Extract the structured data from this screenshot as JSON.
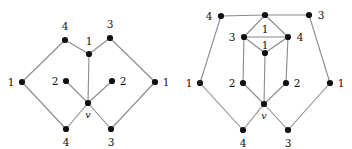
{
  "figure": {
    "background_color": "#ffffff",
    "edge_color": "#8a8a8a",
    "node_color": "#111111",
    "width": 352,
    "height": 149
  },
  "chart_data": {
    "type": "diagram",
    "title": "",
    "diagrams": [
      {
        "name": "left-graph",
        "nodes": [
          {
            "id": "L-top-left-4",
            "label": "4",
            "x": 65,
            "y": 40,
            "label_x": 65,
            "label_y": 26
          },
          {
            "id": "L-top-right-3",
            "label": "3",
            "x": 110,
            "y": 38,
            "label_x": 110,
            "label_y": 24
          },
          {
            "id": "L-inner-1",
            "label": "1",
            "x": 89,
            "y": 54,
            "label_x": 89,
            "label_y": 41
          },
          {
            "id": "L-left-1",
            "label": "1",
            "x": 22,
            "y": 82,
            "label_x": 11,
            "label_y": 82
          },
          {
            "id": "L-right-1",
            "label": "1",
            "x": 155,
            "y": 82,
            "label_x": 166,
            "label_y": 82
          },
          {
            "id": "L-inner-2a",
            "label": "2",
            "x": 66,
            "y": 81,
            "label_x": 55,
            "label_y": 81
          },
          {
            "id": "L-inner-2b",
            "label": "2",
            "x": 112,
            "y": 81,
            "label_x": 123,
            "label_y": 81
          },
          {
            "id": "L-center-v",
            "label": "v",
            "x": 88,
            "y": 103,
            "label_x": 88,
            "label_y": 115,
            "italic": true
          },
          {
            "id": "L-bot-left-4",
            "label": "4",
            "x": 66,
            "y": 129,
            "label_x": 66,
            "label_y": 142
          },
          {
            "id": "L-bot-right-3",
            "label": "3",
            "x": 111,
            "y": 129,
            "label_x": 111,
            "label_y": 142
          }
        ],
        "edges": [
          [
            "L-left-1",
            "L-top-left-4"
          ],
          [
            "L-top-left-4",
            "L-inner-1"
          ],
          [
            "L-inner-1",
            "L-top-right-3"
          ],
          [
            "L-top-right-3",
            "L-right-1"
          ],
          [
            "L-inner-1",
            "L-center-v"
          ],
          [
            "L-inner-2a",
            "L-center-v"
          ],
          [
            "L-inner-2b",
            "L-center-v"
          ],
          [
            "L-left-1",
            "L-bot-left-4"
          ],
          [
            "L-bot-left-4",
            "L-center-v"
          ],
          [
            "L-center-v",
            "L-bot-right-3"
          ],
          [
            "L-bot-right-3",
            "L-right-1"
          ]
        ]
      },
      {
        "name": "right-graph",
        "nodes": [
          {
            "id": "R-top-left-4",
            "label": "4",
            "x": 221,
            "y": 16,
            "label_x": 209,
            "label_y": 16
          },
          {
            "id": "R-top-mid-1",
            "label": "1",
            "x": 265,
            "y": 15,
            "label_x": 265,
            "label_y": 29
          },
          {
            "id": "R-top-right-3",
            "label": "3",
            "x": 309,
            "y": 15,
            "label_x": 321,
            "label_y": 15
          },
          {
            "id": "R-mid-left-3",
            "label": "3",
            "x": 244,
            "y": 37,
            "label_x": 232,
            "label_y": 37
          },
          {
            "id": "R-mid-right-4",
            "label": "4",
            "x": 288,
            "y": 37,
            "label_x": 300,
            "label_y": 37
          },
          {
            "id": "R-inner-1",
            "label": "1",
            "x": 265,
            "y": 53,
            "label_x": 265,
            "label_y": 45
          },
          {
            "id": "R-left-1",
            "label": "1",
            "x": 200,
            "y": 83,
            "label_x": 189,
            "label_y": 83
          },
          {
            "id": "R-right-1",
            "label": "1",
            "x": 330,
            "y": 83,
            "label_x": 341,
            "label_y": 83
          },
          {
            "id": "R-inner-2a",
            "label": "2",
            "x": 243,
            "y": 83,
            "label_x": 232,
            "label_y": 83
          },
          {
            "id": "R-inner-2b",
            "label": "2",
            "x": 286,
            "y": 83,
            "label_x": 297,
            "label_y": 83
          },
          {
            "id": "R-center-v",
            "label": "v",
            "x": 264,
            "y": 104,
            "label_x": 264,
            "label_y": 116,
            "italic": true
          },
          {
            "id": "R-bot-left-4",
            "label": "4",
            "x": 243,
            "y": 130,
            "label_x": 243,
            "label_y": 143
          },
          {
            "id": "R-bot-right-3",
            "label": "3",
            "x": 288,
            "y": 130,
            "label_x": 288,
            "label_y": 143
          }
        ],
        "edges": [
          [
            "R-top-left-4",
            "R-top-mid-1"
          ],
          [
            "R-top-mid-1",
            "R-top-right-3"
          ],
          [
            "R-top-left-4",
            "R-left-1"
          ],
          [
            "R-top-right-3",
            "R-right-1"
          ],
          [
            "R-top-mid-1",
            "R-mid-left-3"
          ],
          [
            "R-top-mid-1",
            "R-mid-right-4"
          ],
          [
            "R-mid-left-3",
            "R-mid-right-4"
          ],
          [
            "R-mid-left-3",
            "R-inner-1"
          ],
          [
            "R-mid-right-4",
            "R-inner-1"
          ],
          [
            "R-inner-1",
            "R-center-v"
          ],
          [
            "R-mid-left-3",
            "R-inner-2a"
          ],
          [
            "R-mid-right-4",
            "R-inner-2b"
          ],
          [
            "R-inner-2a",
            "R-center-v"
          ],
          [
            "R-inner-2b",
            "R-center-v"
          ],
          [
            "R-left-1",
            "R-bot-left-4"
          ],
          [
            "R-bot-left-4",
            "R-center-v"
          ],
          [
            "R-center-v",
            "R-bot-right-3"
          ],
          [
            "R-bot-right-3",
            "R-right-1"
          ]
        ]
      }
    ]
  }
}
